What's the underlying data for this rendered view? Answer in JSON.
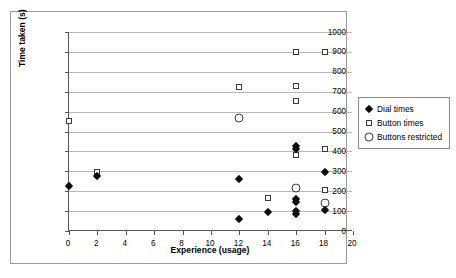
{
  "chart_data": {
    "type": "scatter",
    "title": "",
    "xlabel": "Experience (usage)",
    "ylabel": "Time taken (s)",
    "xlim": [
      0,
      20
    ],
    "ylim": [
      0,
      1000
    ],
    "xticks": [
      0,
      2,
      4,
      6,
      8,
      10,
      12,
      14,
      16,
      18,
      20
    ],
    "yticks": [
      0,
      100,
      200,
      300,
      400,
      500,
      600,
      700,
      800,
      900,
      1000
    ],
    "grid": "horizontal",
    "legend_position": "right",
    "series": [
      {
        "name": "Dial times",
        "marker": "filled-diamond",
        "color": "#0d0d0d",
        "points": [
          {
            "x": 0,
            "y": 225
          },
          {
            "x": 2,
            "y": 275
          },
          {
            "x": 12,
            "y": 260
          },
          {
            "x": 12,
            "y": 62
          },
          {
            "x": 14,
            "y": 96
          },
          {
            "x": 16,
            "y": 425
          },
          {
            "x": 16,
            "y": 412
          },
          {
            "x": 16,
            "y": 162
          },
          {
            "x": 16,
            "y": 148
          },
          {
            "x": 16,
            "y": 100
          },
          {
            "x": 16,
            "y": 85
          },
          {
            "x": 18,
            "y": 295
          },
          {
            "x": 18,
            "y": 106
          }
        ]
      },
      {
        "name": "Button times",
        "marker": "open-square",
        "color": "#3a3a3a",
        "points": [
          {
            "x": 0,
            "y": 552
          },
          {
            "x": 2,
            "y": 296
          },
          {
            "x": 12,
            "y": 726
          },
          {
            "x": 14,
            "y": 168
          },
          {
            "x": 16,
            "y": 898
          },
          {
            "x": 16,
            "y": 731
          },
          {
            "x": 16,
            "y": 651
          },
          {
            "x": 16,
            "y": 384
          },
          {
            "x": 18,
            "y": 898
          },
          {
            "x": 18,
            "y": 414
          },
          {
            "x": 18,
            "y": 208
          }
        ]
      },
      {
        "name": "Buttons restricted",
        "marker": "open-circle",
        "color": "#3a3a3a",
        "points": [
          {
            "x": 12,
            "y": 570
          },
          {
            "x": 16,
            "y": 216
          },
          {
            "x": 18,
            "y": 140
          }
        ]
      }
    ]
  },
  "legend": {
    "items": [
      {
        "label": "Dial times",
        "marker": "filled-diamond"
      },
      {
        "label": "Button times",
        "marker": "open-square"
      },
      {
        "label": "Buttons restricted",
        "marker": "open-circle"
      }
    ]
  }
}
